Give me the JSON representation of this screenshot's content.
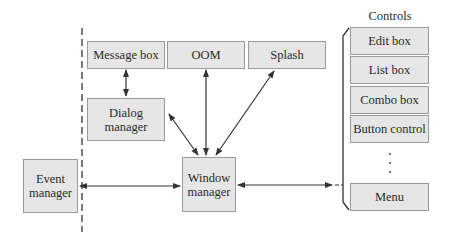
{
  "diagram": {
    "top_row": {
      "message_box": "Message box",
      "oom": "OOM",
      "splash": "Splash"
    },
    "dialog_manager": "Dialog manager",
    "window_manager": "Window manager",
    "event_manager": "Event manager",
    "controls": {
      "title": "Controls",
      "items": [
        "Edit box",
        "List box",
        "Combo box",
        "Button control"
      ],
      "ellipsis": "⋮",
      "last": "Menu"
    },
    "colors": {
      "box_fill": "#e6e6e6",
      "box_border": "#9a9a9a",
      "line": "#333333"
    }
  }
}
